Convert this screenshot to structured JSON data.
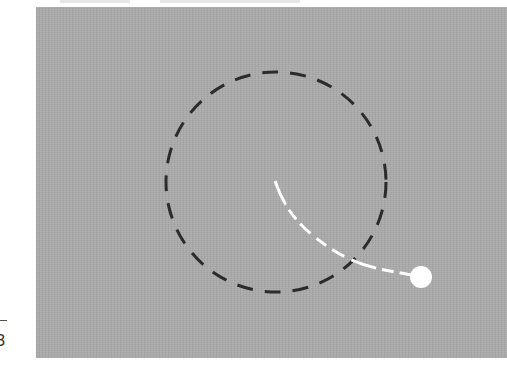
{
  "figure": {
    "background_color": "#a9a9a9",
    "left_margin_glyph": "3",
    "circle": {
      "cx": 276,
      "cy": 182,
      "r": 110,
      "stroke": "#2b2b2b",
      "style": "dashed"
    },
    "trajectory": {
      "stroke": "#ffffff",
      "style": "dashed",
      "start": [
        275,
        181
      ],
      "end": [
        412,
        275
      ]
    },
    "ball": {
      "cx": 421,
      "cy": 277,
      "r": 11,
      "fill": "#ffffff"
    }
  }
}
